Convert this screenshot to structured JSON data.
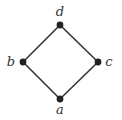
{
  "diagram": {
    "type": "hasse-diagram",
    "colors": {
      "edge": "#333333",
      "node": "#222222",
      "label": "#333333",
      "background": "#ffffff"
    },
    "nodes": [
      {
        "id": "d",
        "label": "d",
        "x": 60,
        "y": 25,
        "label_x": 60,
        "label_y": 16,
        "anchor": "middle"
      },
      {
        "id": "b",
        "label": "b",
        "x": 23,
        "y": 62,
        "label_x": 11,
        "label_y": 66,
        "anchor": "middle"
      },
      {
        "id": "c",
        "label": "c",
        "x": 98,
        "y": 62,
        "label_x": 109,
        "label_y": 66,
        "anchor": "middle"
      },
      {
        "id": "a",
        "label": "a",
        "x": 60,
        "y": 99,
        "label_x": 60,
        "label_y": 114,
        "anchor": "middle"
      }
    ],
    "edges": [
      {
        "from": "a",
        "to": "b"
      },
      {
        "from": "a",
        "to": "c"
      },
      {
        "from": "b",
        "to": "d"
      },
      {
        "from": "c",
        "to": "d"
      }
    ]
  }
}
